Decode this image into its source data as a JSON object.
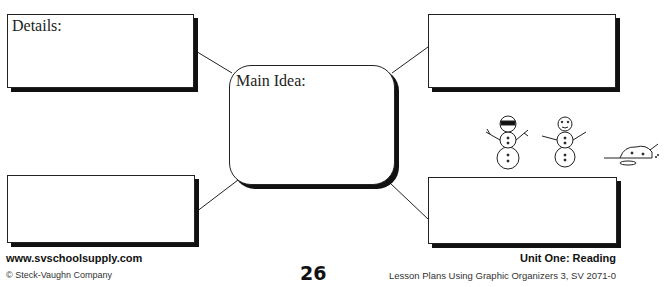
{
  "organizer": {
    "type": "main-idea-and-details",
    "main_idea_label": "Main Idea:",
    "detail_boxes": [
      {
        "position": "top-left",
        "label": "Details:"
      },
      {
        "position": "top-right",
        "label": ""
      },
      {
        "position": "bottom-left",
        "label": ""
      },
      {
        "position": "bottom-right",
        "label": ""
      }
    ]
  },
  "illustration": {
    "name": "snowmen-melting",
    "figures": [
      "snowman-with-sunglasses",
      "snowman-smiling",
      "snowman-melted"
    ]
  },
  "footer": {
    "website": "www.svschoolsupply.com",
    "copyright": "© Steck-Vaughn Company",
    "page_number": "26",
    "unit": "Unit One: Reading",
    "series": "Lesson Plans Using Graphic Organizers 3, SV 2071-0"
  }
}
